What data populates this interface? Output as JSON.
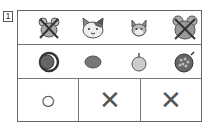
{
  "question": {
    "number": "1"
  },
  "rows": {
    "animals": [
      {
        "icon": "hamster-crossed-icon",
        "crossed": true
      },
      {
        "icon": "calico-cat-icon",
        "crossed": false
      },
      {
        "icon": "squirrel-icon",
        "crossed": false
      },
      {
        "icon": "hamster-crossed-icon",
        "crossed": true
      }
    ],
    "fruits": [
      {
        "icon": "dark-plum-icon"
      },
      {
        "icon": "tangerine-icon"
      },
      {
        "icon": "apple-icon"
      },
      {
        "icon": "pomegranate-icon"
      }
    ],
    "answers": [
      {
        "mark": "○",
        "meaning": "circle"
      },
      {
        "mark": "✕",
        "meaning": "cross"
      },
      {
        "mark": "✕",
        "meaning": "cross"
      }
    ]
  },
  "colors": {
    "line": "#666666",
    "mark": "#555555",
    "icon_gray": "#888888"
  }
}
